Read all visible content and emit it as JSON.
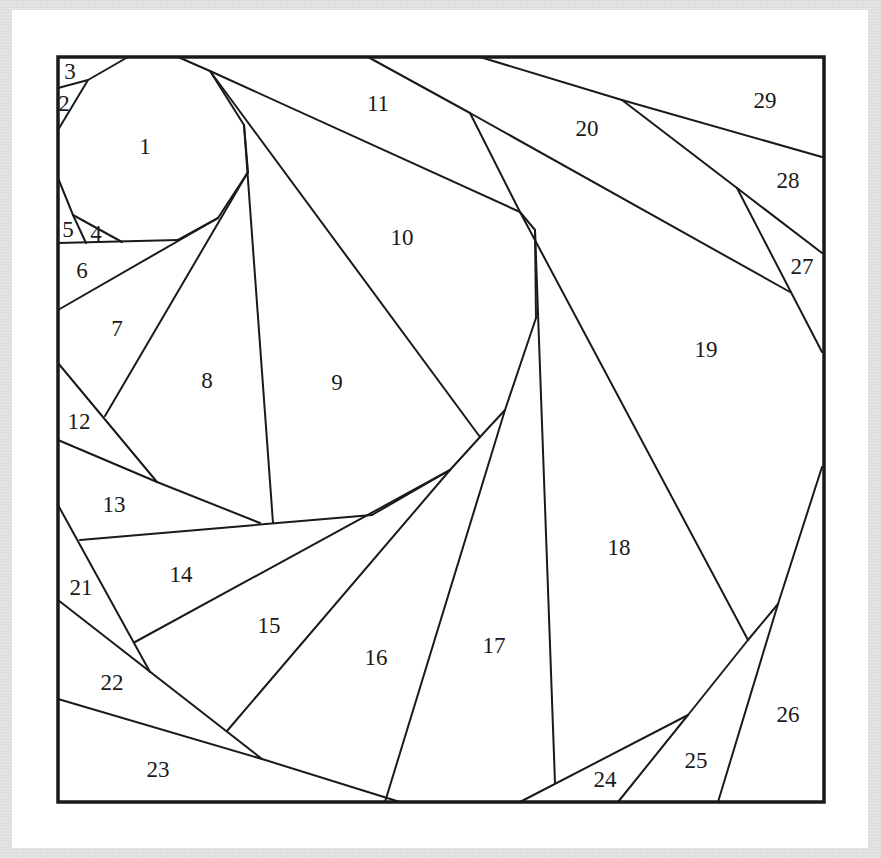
{
  "diagram": {
    "type": "paper-piecing-pattern",
    "frame": {
      "x": 58,
      "y": 57,
      "width": 766,
      "height": 745,
      "stroke": "#1a1a1a",
      "stroke_width": 3.5
    },
    "line_color": "#1a1a1a",
    "card_color": "#ffffff",
    "background_color": "#dcdcdc",
    "segments": [
      [
        58,
        88,
        88,
        80
      ],
      [
        88,
        80,
        128,
        57
      ],
      [
        58,
        130,
        88,
        80
      ],
      [
        58,
        178,
        73,
        215
      ],
      [
        73,
        215,
        122,
        242
      ],
      [
        73,
        215,
        86,
        243
      ],
      [
        58,
        243,
        178,
        240
      ],
      [
        178,
        57,
        210,
        71
      ],
      [
        210,
        71,
        244,
        125
      ],
      [
        244,
        125,
        248,
        172
      ],
      [
        248,
        172,
        218,
        218
      ],
      [
        218,
        218,
        178,
        240
      ],
      [
        58,
        310,
        218,
        218
      ],
      [
        105,
        416,
        248,
        172
      ],
      [
        244,
        125,
        273,
        523
      ],
      [
        210,
        71,
        520,
        212
      ],
      [
        210,
        71,
        480,
        437
      ],
      [
        368,
        57,
        470,
        113
      ],
      [
        470,
        113,
        520,
        212
      ],
      [
        470,
        113,
        790,
        292
      ],
      [
        520,
        212,
        535,
        230
      ],
      [
        535,
        230,
        555,
        783
      ],
      [
        535,
        230,
        536,
        318
      ],
      [
        480,
        57,
        622,
        100
      ],
      [
        622,
        100,
        822,
        157
      ],
      [
        622,
        100,
        737,
        188
      ],
      [
        737,
        188,
        822,
        253
      ],
      [
        737,
        188,
        822,
        352
      ],
      [
        520,
        212,
        748,
        640
      ],
      [
        536,
        318,
        505,
        410
      ],
      [
        505,
        410,
        480,
        437
      ],
      [
        480,
        437,
        450,
        470
      ],
      [
        450,
        470,
        372,
        515
      ],
      [
        505,
        410,
        385,
        802
      ],
      [
        450,
        470,
        227,
        731
      ],
      [
        58,
        363,
        157,
        482
      ],
      [
        58,
        440,
        157,
        482
      ],
      [
        157,
        482,
        260,
        523
      ],
      [
        80,
        540,
        372,
        515
      ],
      [
        58,
        505,
        150,
        672
      ],
      [
        135,
        642,
        450,
        470
      ],
      [
        58,
        600,
        262,
        759
      ],
      [
        58,
        699,
        262,
        759
      ],
      [
        262,
        759,
        400,
        802
      ],
      [
        748,
        640,
        778,
        604
      ],
      [
        778,
        604,
        822,
        467
      ],
      [
        748,
        640,
        688,
        715
      ],
      [
        688,
        715,
        520,
        802
      ],
      [
        688,
        715,
        618,
        802
      ],
      [
        778,
        604,
        718,
        802
      ]
    ],
    "pieces": [
      {
        "number": "1",
        "x": 145,
        "y": 146
      },
      {
        "number": "2",
        "x": 64,
        "y": 103
      },
      {
        "number": "3",
        "x": 70,
        "y": 71
      },
      {
        "number": "4",
        "x": 96,
        "y": 233
      },
      {
        "number": "5",
        "x": 68,
        "y": 229
      },
      {
        "number": "6",
        "x": 82,
        "y": 270
      },
      {
        "number": "7",
        "x": 117,
        "y": 328
      },
      {
        "number": "8",
        "x": 207,
        "y": 380
      },
      {
        "number": "9",
        "x": 337,
        "y": 382
      },
      {
        "number": "10",
        "x": 402,
        "y": 237
      },
      {
        "number": "11",
        "x": 378,
        "y": 103
      },
      {
        "number": "12",
        "x": 79,
        "y": 421
      },
      {
        "number": "13",
        "x": 114,
        "y": 504
      },
      {
        "number": "14",
        "x": 181,
        "y": 574
      },
      {
        "number": "15",
        "x": 269,
        "y": 625
      },
      {
        "number": "16",
        "x": 376,
        "y": 657
      },
      {
        "number": "17",
        "x": 494,
        "y": 645
      },
      {
        "number": "18",
        "x": 619,
        "y": 547
      },
      {
        "number": "19",
        "x": 706,
        "y": 349
      },
      {
        "number": "20",
        "x": 587,
        "y": 128
      },
      {
        "number": "21",
        "x": 81,
        "y": 587
      },
      {
        "number": "22",
        "x": 112,
        "y": 682
      },
      {
        "number": "23",
        "x": 158,
        "y": 769
      },
      {
        "number": "24",
        "x": 605,
        "y": 779
      },
      {
        "number": "25",
        "x": 696,
        "y": 760
      },
      {
        "number": "26",
        "x": 788,
        "y": 714
      },
      {
        "number": "27",
        "x": 802,
        "y": 266
      },
      {
        "number": "28",
        "x": 788,
        "y": 180
      },
      {
        "number": "29",
        "x": 765,
        "y": 100
      }
    ]
  }
}
